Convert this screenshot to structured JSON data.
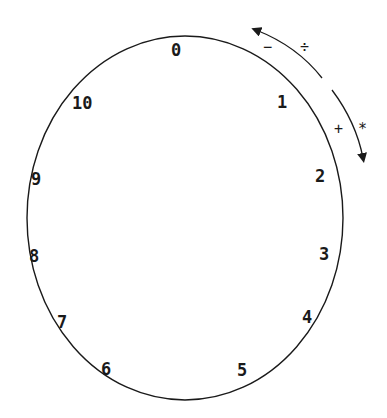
{
  "diagram": {
    "type": "modular-clock",
    "colors": {
      "stroke": "#1a1a1a",
      "background": "#ffffff"
    },
    "clock": {
      "shape": "ellipse",
      "cx": 185,
      "cy": 218,
      "rx": 158,
      "ry": 182,
      "labels": [
        {
          "text": "0",
          "x": 171,
          "y": 56
        },
        {
          "text": "1",
          "x": 277,
          "y": 108
        },
        {
          "text": "2",
          "x": 315,
          "y": 182
        },
        {
          "text": "3",
          "x": 319,
          "y": 260
        },
        {
          "text": "4",
          "x": 302,
          "y": 323
        },
        {
          "text": "5",
          "x": 237,
          "y": 376
        },
        {
          "text": "6",
          "x": 101,
          "y": 375
        },
        {
          "text": "7",
          "x": 57,
          "y": 328
        },
        {
          "text": "8",
          "x": 29,
          "y": 262
        },
        {
          "text": "9",
          "x": 31,
          "y": 185
        },
        {
          "text": "10",
          "x": 72,
          "y": 109
        }
      ]
    },
    "arrows": [
      {
        "name": "backward-arrow",
        "direction": "counterclockwise",
        "operators": [
          "−",
          "÷"
        ]
      },
      {
        "name": "forward-arrow",
        "direction": "clockwise",
        "operators": [
          "+",
          "*"
        ]
      }
    ],
    "operator_labels": [
      {
        "text": "−",
        "x": 263,
        "y": 52
      },
      {
        "text": "÷",
        "x": 300,
        "y": 52
      },
      {
        "text": "+",
        "x": 334,
        "y": 134
      },
      {
        "text": "*",
        "x": 358,
        "y": 134
      }
    ]
  }
}
